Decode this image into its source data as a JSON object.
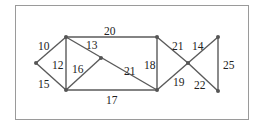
{
  "diagram": {
    "type": "weighted-graph",
    "nodes": [
      {
        "id": "A",
        "x": 36,
        "y": 63
      },
      {
        "id": "B",
        "x": 66,
        "y": 37
      },
      {
        "id": "C",
        "x": 66,
        "y": 90
      },
      {
        "id": "D",
        "x": 101,
        "y": 58
      },
      {
        "id": "E",
        "x": 157,
        "y": 37
      },
      {
        "id": "F",
        "x": 157,
        "y": 90
      },
      {
        "id": "G",
        "x": 188,
        "y": 63
      },
      {
        "id": "H",
        "x": 218,
        "y": 37
      },
      {
        "id": "I",
        "x": 218,
        "y": 91
      }
    ],
    "edges": [
      {
        "from": "A",
        "to": "B",
        "weight": "10",
        "lx": 38,
        "ly": 50
      },
      {
        "from": "A",
        "to": "C",
        "weight": "15",
        "lx": 38,
        "ly": 88
      },
      {
        "from": "B",
        "to": "C",
        "weight": "12",
        "lx": 52,
        "ly": 69
      },
      {
        "from": "B",
        "to": "E",
        "weight": "20",
        "lx": 104,
        "ly": 35
      },
      {
        "from": "B",
        "to": "F",
        "weight": "13",
        "lx": 86,
        "ly": 49
      },
      {
        "from": "C",
        "to": "D",
        "weight": "16",
        "lx": 72,
        "ly": 73
      },
      {
        "from": "B",
        "to": "F",
        "weight": "21",
        "lx": 124,
        "ly": 75
      },
      {
        "from": "C",
        "to": "F",
        "weight": "17",
        "lx": 106,
        "ly": 104
      },
      {
        "from": "E",
        "to": "F",
        "weight": "18",
        "lx": 144,
        "ly": 69
      },
      {
        "from": "E",
        "to": "G",
        "weight": "21",
        "lx": 172,
        "ly": 50
      },
      {
        "from": "F",
        "to": "G",
        "weight": "19",
        "lx": 173,
        "ly": 86
      },
      {
        "from": "G",
        "to": "H",
        "weight": "14",
        "lx": 192,
        "ly": 50
      },
      {
        "from": "G",
        "to": "I",
        "weight": "22",
        "lx": 194,
        "ly": 89
      },
      {
        "from": "H",
        "to": "I",
        "weight": "25",
        "lx": 223,
        "ly": 69
      }
    ]
  }
}
